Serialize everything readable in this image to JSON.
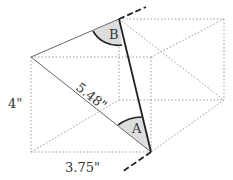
{
  "diagram": {
    "labels": {
      "height": "4\"",
      "width": "3.75\"",
      "diagonal": "5.48\"",
      "angle_a": "A",
      "angle_b": "B"
    },
    "colors": {
      "solid_line": "#222222",
      "thin_line": "#666666",
      "dotted_line": "#999999",
      "angle_fill": "#dddddd"
    }
  }
}
